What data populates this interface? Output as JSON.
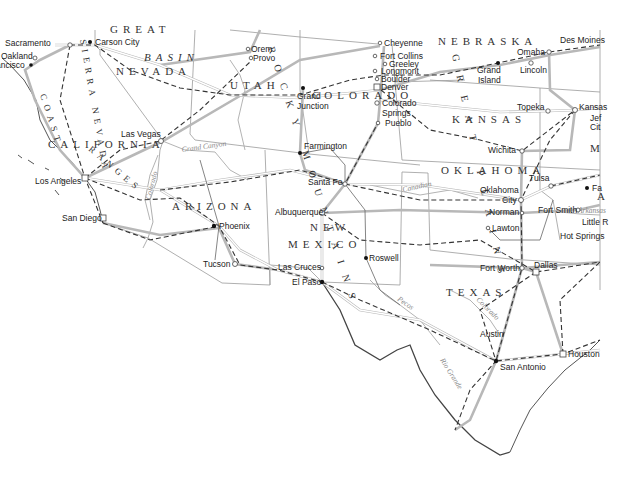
{
  "map": {
    "title": "Southwestern United States road and rail map",
    "states": [
      {
        "name": "NEVADA",
        "x": 116,
        "y": 75
      },
      {
        "name": "UTAH",
        "x": 230,
        "y": 89
      },
      {
        "name": "COLORADO",
        "x": 312,
        "y": 99
      },
      {
        "name": "NEBRASKA",
        "x": 438,
        "y": 45
      },
      {
        "name": "KANSAS",
        "x": 452,
        "y": 123
      },
      {
        "name": "CALIFORNIA",
        "x": 48,
        "y": 148
      },
      {
        "name": "ARIZONA",
        "x": 172,
        "y": 210
      },
      {
        "name": "NEW",
        "x": 310,
        "y": 231
      },
      {
        "name": "MEXICO",
        "x": 288,
        "y": 248
      },
      {
        "name": "OKLAHOMA",
        "x": 441,
        "y": 174
      },
      {
        "name": "TEXAS",
        "x": 446,
        "y": 296
      },
      {
        "name": "M",
        "x": 590,
        "y": 152
      },
      {
        "name": "A",
        "x": 597,
        "y": 200
      }
    ],
    "regions": [
      {
        "name": "BASIN",
        "x": 144,
        "y": 61
      },
      {
        "name": "GREAT",
        "x": 110,
        "y": 33
      }
    ],
    "vertical_labels": [
      {
        "name": "SIERRA NEVADA",
        "x": 80,
        "y": 40,
        "rotate": 80
      },
      {
        "name": "COAST",
        "x": 40,
        "y": 95,
        "rotate": 72
      },
      {
        "name": "RANGES",
        "x": 88,
        "y": 150,
        "rotate": 40
      },
      {
        "name": "ROCKY MOUNTAINS",
        "x": 268,
        "y": 48,
        "rotate": 72
      },
      {
        "name": "GREAT PLAINS",
        "x": 452,
        "y": 55,
        "rotate": 78
      }
    ],
    "rivers": [
      {
        "name": "Grand Canyon",
        "x": 182,
        "y": 152,
        "rotate": -8
      },
      {
        "name": "Colorado",
        "x": 150,
        "y": 200,
        "rotate": -75
      },
      {
        "name": "Canadian",
        "x": 403,
        "y": 192,
        "rotate": -12
      },
      {
        "name": "Pecos",
        "x": 397,
        "y": 300,
        "rotate": 35
      },
      {
        "name": "Colorado",
        "x": 476,
        "y": 300,
        "rotate": 45
      },
      {
        "name": "Rio Grande",
        "x": 440,
        "y": 360,
        "rotate": 58
      },
      {
        "name": "Arkansas",
        "x": 578,
        "y": 213,
        "rotate": 0
      }
    ],
    "cities": [
      {
        "name": "Sacramento",
        "x": 5,
        "y": 46,
        "dx": 70,
        "dy": 45,
        "marker": "ring"
      },
      {
        "name": "Carson City",
        "x": 95,
        "y": 45,
        "dx": 90,
        "dy": 42,
        "marker": "dot"
      },
      {
        "name": "Oakland",
        "x": 1,
        "y": 58,
        "dx": 35,
        "dy": 58,
        "marker": "ring"
      },
      {
        "name": "Francisco",
        "x": 0,
        "y": 68,
        "dx": 31,
        "dy": 65,
        "marker": "dot"
      },
      {
        "name": "Orem",
        "x": 250,
        "y": 52,
        "dx": 248,
        "dy": 49,
        "marker": "ring"
      },
      {
        "name": "Provo",
        "x": 252,
        "y": 62,
        "dx": 251,
        "dy": 58,
        "marker": "ring"
      },
      {
        "name": "Cheyenne",
        "x": 384,
        "y": 46,
        "dx": 380,
        "dy": 43,
        "marker": "ring"
      },
      {
        "name": "Fort Collins",
        "x": 380,
        "y": 59,
        "dx": 375,
        "dy": 56,
        "marker": "ring"
      },
      {
        "name": "Greeley",
        "x": 389,
        "y": 67,
        "dx": 385,
        "dy": 64,
        "marker": "ring"
      },
      {
        "name": "Longmont",
        "x": 381,
        "y": 74,
        "dx": 375,
        "dy": 71,
        "marker": "ring"
      },
      {
        "name": "Boulder",
        "x": 381,
        "y": 82,
        "dx": 377,
        "dy": 79,
        "marker": "ring"
      },
      {
        "name": "Denver",
        "x": 381,
        "y": 90,
        "dx": 377,
        "dy": 87,
        "marker": "ring"
      },
      {
        "name": "Colorado",
        "x": 382,
        "y": 106,
        "dx": 377,
        "dy": 103,
        "marker": "ring"
      },
      {
        "name": "Springs",
        "x": 382,
        "y": 116,
        "dx": 0,
        "dy": 0,
        "marker": "none"
      },
      {
        "name": "Pueblo",
        "x": 385,
        "y": 126,
        "dx": 378,
        "dy": 123,
        "marker": "ring"
      },
      {
        "name": "Grand",
        "x": 296,
        "y": 98,
        "dx": 303,
        "dy": 88,
        "marker": "dot"
      },
      {
        "name": "Junction",
        "x": 296,
        "y": 108,
        "dx": 0,
        "dy": 0,
        "marker": "none"
      },
      {
        "name": "Omaha",
        "x": 517,
        "y": 55,
        "dx": 549,
        "dy": 52,
        "marker": "ring"
      },
      {
        "name": "Des Moines",
        "x": 560,
        "y": 43,
        "dx": 0,
        "dy": 0,
        "marker": "none"
      },
      {
        "name": "Grand",
        "x": 477,
        "y": 73,
        "dx": 498,
        "dy": 63,
        "marker": "dot"
      },
      {
        "name": "Island",
        "x": 477,
        "y": 83,
        "dx": 0,
        "dy": 0,
        "marker": "none"
      },
      {
        "name": "Lincoln",
        "x": 520,
        "y": 73,
        "dx": 531,
        "dy": 63,
        "marker": "ring"
      },
      {
        "name": "Topeka",
        "x": 517,
        "y": 110,
        "dx": 548,
        "dy": 111,
        "marker": "ring"
      },
      {
        "name": "Kansas",
        "x": 579,
        "y": 110,
        "dx": 575,
        "dy": 110,
        "marker": "ring"
      },
      {
        "name": "Jef",
        "x": 590,
        "y": 121,
        "dx": 0,
        "dy": 0,
        "marker": "none"
      },
      {
        "name": "Cit",
        "x": 590,
        "y": 130,
        "dx": 0,
        "dy": 0,
        "marker": "none"
      },
      {
        "name": "Las Vegas",
        "x": 121,
        "y": 137,
        "dx": 161,
        "dy": 141,
        "marker": "ring"
      },
      {
        "name": "Farmington",
        "x": 304,
        "y": 149,
        "dx": 300,
        "dy": 153,
        "marker": "dot"
      },
      {
        "name": "Wichita",
        "x": 488,
        "y": 153,
        "dx": 522,
        "dy": 151,
        "marker": "ring"
      },
      {
        "name": "Santa Fe",
        "x": 308,
        "y": 185,
        "dx": 345,
        "dy": 184,
        "marker": "ring"
      },
      {
        "name": "Los Angeles",
        "x": 35,
        "y": 184,
        "dx": 85,
        "dy": 178,
        "marker": "ring"
      },
      {
        "name": "Tulsa",
        "x": 529,
        "y": 181,
        "dx": 551,
        "dy": 186,
        "marker": "ring"
      },
      {
        "name": "Oklahoma",
        "x": 480,
        "y": 193,
        "dx": 521,
        "dy": 200,
        "marker": "ring"
      },
      {
        "name": "City",
        "x": 502,
        "y": 203,
        "dx": 0,
        "dy": 0,
        "marker": "none"
      },
      {
        "name": "Fa",
        "x": 592,
        "y": 191,
        "dx": 587,
        "dy": 188,
        "marker": "dot"
      },
      {
        "name": "Albuquerque",
        "x": 275,
        "y": 215,
        "dx": 322,
        "dy": 213,
        "marker": "ring"
      },
      {
        "name": "San Diego",
        "x": 62,
        "y": 221,
        "dx": 103,
        "dy": 218,
        "marker": "ring"
      },
      {
        "name": "Norman",
        "x": 489,
        "y": 215,
        "dx": 522,
        "dy": 213,
        "marker": "ring"
      },
      {
        "name": "Fort Smith",
        "x": 538,
        "y": 213,
        "dx": 578,
        "dy": 210,
        "marker": "ring"
      },
      {
        "name": "Little R",
        "x": 582,
        "y": 225,
        "dx": 0,
        "dy": 0,
        "marker": "none"
      },
      {
        "name": "Phoenix",
        "x": 219,
        "y": 229,
        "dx": 214,
        "dy": 226,
        "marker": "dot"
      },
      {
        "name": "Lawton",
        "x": 492,
        "y": 231,
        "dx": 488,
        "dy": 228,
        "marker": "ring"
      },
      {
        "name": "Hot Springs",
        "x": 560,
        "y": 239,
        "dx": 0,
        "dy": 0,
        "marker": "none"
      },
      {
        "name": "Roswell",
        "x": 369,
        "y": 261,
        "dx": 366,
        "dy": 258,
        "marker": "dot"
      },
      {
        "name": "Tucson",
        "x": 203,
        "y": 267,
        "dx": 235,
        "dy": 264,
        "marker": "ring"
      },
      {
        "name": "Las Cruces",
        "x": 278,
        "y": 270,
        "dx": 322,
        "dy": 268,
        "marker": "ring"
      },
      {
        "name": "Fort Worth",
        "x": 480,
        "y": 271,
        "dx": 522,
        "dy": 268,
        "marker": "ring"
      },
      {
        "name": "Dallas",
        "x": 534,
        "y": 268,
        "dx": 536,
        "dy": 272,
        "marker": "ring"
      },
      {
        "name": "El Paso",
        "x": 292,
        "y": 285,
        "dx": 322,
        "dy": 282,
        "marker": "dot"
      },
      {
        "name": "Austin",
        "x": 480,
        "y": 337,
        "dx": 0,
        "dy": 0,
        "marker": "none"
      },
      {
        "name": "Houston",
        "x": 568,
        "y": 357,
        "dx": 563,
        "dy": 354,
        "marker": "ring"
      },
      {
        "name": "San Antonio",
        "x": 500,
        "y": 370,
        "dx": 496,
        "dy": 361,
        "marker": "dot"
      }
    ]
  }
}
